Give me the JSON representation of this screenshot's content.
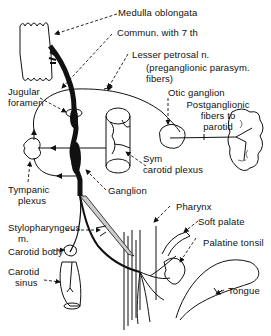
{
  "diagram": {
    "colors": {
      "ink": "#111111",
      "background": "#ffffff"
    },
    "labels": {
      "medulla": "Medulla oblongata",
      "commun": "Commun. with 7 th",
      "lesser_petrosal_1": "Lesser petrosal n.",
      "lesser_petrosal_2": "(preganglionic parasym.",
      "lesser_petrosal_3": "fibers)",
      "jugular_1": "Jugular",
      "jugular_2": "foramen",
      "otic": "Otic ganglion",
      "postganglionic_1": "Postganglionic",
      "postganglionic_2": "fibers to",
      "postganglionic_3": "parotid",
      "sym_1": "Sym",
      "sym_2": "carotid plexus",
      "tympanic_1": "Tympanic",
      "tympanic_2": "plexus",
      "ganglion": "Ganglion",
      "pharynx": "Pharynx",
      "soft_palate": "Soft palate",
      "stylopharyngeus_1": "Stylopharyngeus",
      "stylopharyngeus_2": "m.",
      "palatine_tonsil": "Palatine tonsil",
      "carotid_body": "Carotid body",
      "carotid_sinus_1": "Carotid",
      "carotid_sinus_2": "sinus",
      "tongue": "Tongue"
    }
  }
}
